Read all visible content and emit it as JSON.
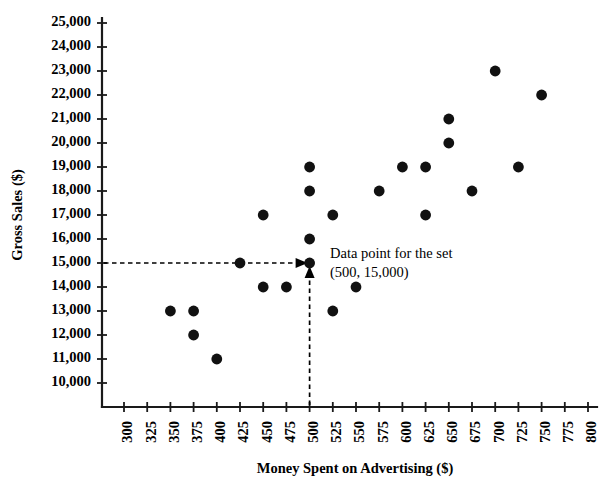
{
  "chart_data": {
    "type": "scatter",
    "title": "",
    "xlabel": "Money Spent on Advertising ($)",
    "ylabel": "Gross Sales ($)",
    "xlim": [
      300,
      800
    ],
    "ylim": [
      10000,
      25000
    ],
    "xtick_step": 25,
    "ytick_step": 1000,
    "grid": false,
    "legend": null,
    "xticks": [
      "300",
      "325",
      "350",
      "375",
      "400",
      "425",
      "450",
      "475",
      "500",
      "525",
      "550",
      "575",
      "600",
      "625",
      "650",
      "675",
      "700",
      "725",
      "750",
      "775",
      "800"
    ],
    "yticks": [
      "25,000",
      "24,000",
      "23,000",
      "22,000",
      "21,000",
      "20,000",
      "19,000",
      "18,000",
      "17,000",
      "16,000",
      "15,000",
      "14,000",
      "13,000",
      "12,000",
      "11,000",
      "10,000"
    ],
    "points": [
      {
        "x": 350,
        "y": 13000
      },
      {
        "x": 375,
        "y": 13000
      },
      {
        "x": 375,
        "y": 12000
      },
      {
        "x": 400,
        "y": 11000
      },
      {
        "x": 425,
        "y": 15000
      },
      {
        "x": 450,
        "y": 14000
      },
      {
        "x": 450,
        "y": 17000
      },
      {
        "x": 475,
        "y": 14000
      },
      {
        "x": 500,
        "y": 19000
      },
      {
        "x": 500,
        "y": 18000
      },
      {
        "x": 500,
        "y": 16000
      },
      {
        "x": 500,
        "y": 15000
      },
      {
        "x": 525,
        "y": 17000
      },
      {
        "x": 525,
        "y": 13000
      },
      {
        "x": 550,
        "y": 14000
      },
      {
        "x": 575,
        "y": 18000
      },
      {
        "x": 600,
        "y": 19000
      },
      {
        "x": 625,
        "y": 19000
      },
      {
        "x": 625,
        "y": 17000
      },
      {
        "x": 650,
        "y": 21000
      },
      {
        "x": 650,
        "y": 20000
      },
      {
        "x": 675,
        "y": 18000
      },
      {
        "x": 700,
        "y": 23000
      },
      {
        "x": 725,
        "y": 19000
      },
      {
        "x": 750,
        "y": 22000
      }
    ],
    "annotation": {
      "line1": "Data point for the set",
      "line2": "(500, 15,000)",
      "target_x": 500,
      "target_y": 15000
    },
    "colors": {
      "marker": "#111111",
      "axis": "#1a1a1a",
      "background": "#ffffff",
      "guide": "#000000"
    }
  }
}
